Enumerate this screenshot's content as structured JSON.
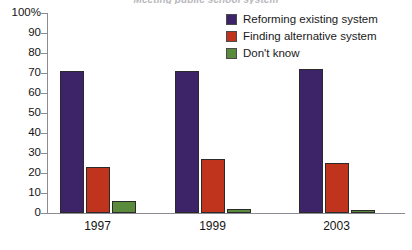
{
  "chart_data": {
    "type": "bar",
    "title": "Meeting public school system",
    "categories": [
      "1997",
      "1999",
      "2003"
    ],
    "series": [
      {
        "name": "Reforming existing system",
        "color": "#3d2469",
        "values": [
          71,
          71,
          72
        ]
      },
      {
        "name": "Finding alternative system",
        "color": "#c0341d",
        "values": [
          23,
          27,
          25
        ]
      },
      {
        "name": "Don't know",
        "color": "#5a8a3c",
        "values": [
          6,
          2,
          1.5
        ]
      }
    ],
    "xlabel": "",
    "ylabel": "",
    "ylim": [
      0,
      100
    ],
    "ytick_labels": [
      "100%",
      "90",
      "80",
      "70",
      "60",
      "50",
      "40",
      "30",
      "20",
      "10",
      "0"
    ],
    "ytick_values": [
      100,
      90,
      80,
      70,
      60,
      50,
      40,
      30,
      20,
      10,
      0
    ],
    "grid": false,
    "legend_position": "top-right"
  },
  "legend": {
    "items": [
      {
        "label": "Reforming existing system",
        "color": "#3d2469"
      },
      {
        "label": "Finding alternative system",
        "color": "#c0341d"
      },
      {
        "label": "Don't know",
        "color": "#5a8a3c"
      }
    ]
  }
}
